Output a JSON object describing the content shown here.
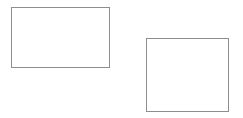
{
  "canvas": {
    "width": 243,
    "height": 118,
    "background_color": "#ffffff",
    "title": "Two outlined rectangles"
  },
  "shapes": [
    {
      "name": "rectangle-wide",
      "type": "rectangle",
      "label": "Wide rectangle",
      "x": 11,
      "y": 7,
      "width": 99,
      "height": 61,
      "stroke_color": "#8e8e8e",
      "stroke_width": 1,
      "fill_color": "transparent"
    },
    {
      "name": "rectangle-square",
      "type": "rectangle",
      "label": "Square rectangle",
      "x": 146,
      "y": 38,
      "width": 83,
      "height": 74,
      "stroke_color": "#8e8e8e",
      "stroke_width": 1,
      "fill_color": "transparent"
    }
  ]
}
